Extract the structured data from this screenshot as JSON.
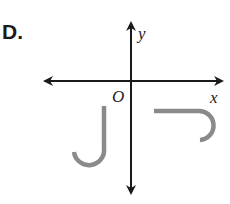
{
  "option_label": "D.",
  "axes": {
    "x_label": "x",
    "y_label": "y",
    "origin_label": "O"
  },
  "colors": {
    "axis": "#1a1a1a",
    "shape": "#8a8a8a"
  },
  "shapes": [
    {
      "name": "j-shape-left",
      "description": "J shape in quadrant III"
    },
    {
      "name": "j-shape-right",
      "description": "J shape rotated, in quadrant IV"
    }
  ]
}
